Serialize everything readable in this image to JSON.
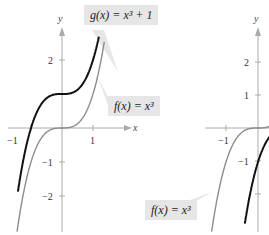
{
  "left_graph": {
    "axis_labels": {
      "x": "x",
      "y": "y"
    },
    "x_ticks": [
      {
        "value": -1,
        "label": "−1"
      },
      {
        "value": 1,
        "label": "1"
      }
    ],
    "y_ticks": [
      {
        "value": 2,
        "label": "2"
      },
      {
        "value": -1,
        "label": "−1"
      },
      {
        "value": -2,
        "label": "−2"
      }
    ],
    "curves": [
      {
        "name": "g",
        "label": "g(x) = x³ + 1",
        "color": "#111111"
      },
      {
        "name": "f",
        "label": "f(x) = x³",
        "color": "#8c8c8c"
      }
    ]
  },
  "right_graph": {
    "axis_labels": {
      "y": "y"
    },
    "x_ticks": [
      {
        "value": -1,
        "label": "−1"
      }
    ],
    "y_ticks": [
      {
        "value": 2,
        "label": "2"
      },
      {
        "value": 1,
        "label": "1"
      },
      {
        "value": -1,
        "label": "−1"
      }
    ],
    "curves": [
      {
        "name": "f",
        "label": "f(x) = x³",
        "color": "#8c8c8c"
      },
      {
        "name": "h",
        "label": "",
        "color": "#111111"
      }
    ]
  },
  "labels": {
    "g_left": "g(x) = x³ + 1",
    "f_left": "f(x) = x³",
    "f_right": "f(x) = x³"
  }
}
